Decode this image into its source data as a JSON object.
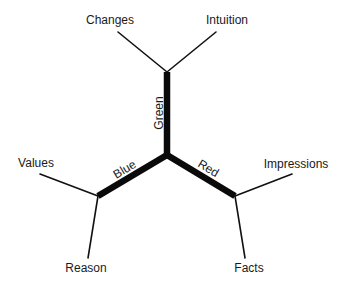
{
  "diagram": {
    "type": "tree-y-branch",
    "center": {
      "x": 167,
      "y": 155
    },
    "branches": [
      {
        "id": "green",
        "label": "Green",
        "node": {
          "x": 167,
          "y": 72
        },
        "label_pos": {
          "x": 160,
          "y": 113,
          "rotate": -90
        },
        "leaves": [
          {
            "label": "Changes",
            "end": {
              "x": 118,
              "y": 32
            },
            "text_pos": {
              "x": 110,
              "y": 24
            }
          },
          {
            "label": "Intuition",
            "end": {
              "x": 216,
              "y": 32
            },
            "text_pos": {
              "x": 227,
              "y": 24
            }
          }
        ]
      },
      {
        "id": "blue",
        "label": "Blue",
        "node": {
          "x": 98,
          "y": 196
        },
        "label_pos": {
          "x": 125,
          "y": 170,
          "rotate": -31
        },
        "leaves": [
          {
            "label": "Values",
            "end": {
              "x": 40,
              "y": 174
            },
            "text_pos": {
              "x": 36,
              "y": 167
            }
          },
          {
            "label": "Reason",
            "end": {
              "x": 88,
              "y": 258
            },
            "text_pos": {
              "x": 86,
              "y": 272
            }
          }
        ]
      },
      {
        "id": "red",
        "label": "Red",
        "node": {
          "x": 235,
          "y": 196
        },
        "label_pos": {
          "x": 208,
          "y": 169,
          "rotate": 31
        },
        "leaves": [
          {
            "label": "Impressions",
            "end": {
              "x": 292,
              "y": 174
            },
            "text_pos": {
              "x": 296,
              "y": 168
            }
          },
          {
            "label": "Facts",
            "end": {
              "x": 245,
              "y": 258
            },
            "text_pos": {
              "x": 249,
              "y": 272
            }
          }
        ]
      }
    ],
    "colors": {
      "line": "#111111",
      "text": "#1a1a1a",
      "background": "#ffffff"
    }
  }
}
